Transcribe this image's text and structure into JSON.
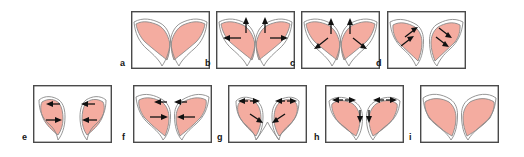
{
  "figure": {
    "title": "",
    "background_color": "#ffffff",
    "width": 524,
    "height": 157,
    "fill_color": "#f4aca0",
    "outline_color": "#8a8a8a",
    "frame_color": "#4a4a4a",
    "arrow_color": "#111111",
    "rows": 2,
    "panel_count": 9
  },
  "panels": [
    {
      "id": "a",
      "label": "a",
      "row": 1,
      "x": 131,
      "y": 11,
      "width": 79,
      "height": 58,
      "arrows": [],
      "arrow_count": 0,
      "description": "baseline symmetric paired lobes meeting at midline"
    },
    {
      "id": "b",
      "label": "b",
      "row": 1,
      "x": 216,
      "y": 11,
      "width": 79,
      "height": 58,
      "arrow_count": 4,
      "arrows": [
        {
          "direction": "up",
          "side": "left"
        },
        {
          "direction": "up",
          "side": "right"
        },
        {
          "direction": "left",
          "side": "left"
        },
        {
          "direction": "right",
          "side": "right"
        }
      ],
      "description": "upward and outward expansion arrows on both lobes"
    },
    {
      "id": "c",
      "label": "c",
      "row": 1,
      "x": 301,
      "y": 11,
      "width": 79,
      "height": 58,
      "arrow_count": 4,
      "arrows": [
        {
          "direction": "up",
          "side": "left"
        },
        {
          "direction": "up",
          "side": "right"
        },
        {
          "direction": "down-left",
          "side": "left"
        },
        {
          "direction": "down-right",
          "side": "right"
        }
      ],
      "description": "upward arrows with diagonal downward-outward arrows"
    },
    {
      "id": "d",
      "label": "d",
      "row": 1,
      "x": 387,
      "y": 11,
      "width": 79,
      "height": 58,
      "arrow_count": 4,
      "arrows": [
        {
          "direction": "up-right",
          "side": "left"
        },
        {
          "direction": "up-right",
          "side": "left"
        },
        {
          "direction": "down-right",
          "side": "right"
        },
        {
          "direction": "down-right",
          "side": "right"
        }
      ],
      "description": "paired diagonal arrows on narrowed separated lobes"
    },
    {
      "id": "e",
      "label": "e",
      "row": 2,
      "x": 33,
      "y": 85,
      "width": 79,
      "height": 58,
      "arrow_count": 4,
      "arrows": [
        {
          "direction": "left",
          "side": "left-top"
        },
        {
          "direction": "left",
          "side": "right-top"
        },
        {
          "direction": "right",
          "side": "left-mid"
        },
        {
          "direction": "left",
          "side": "right-mid"
        }
      ],
      "description": "horizontal inward arrows at top and middle of both lobes"
    },
    {
      "id": "f",
      "label": "f",
      "row": 2,
      "x": 133,
      "y": 85,
      "width": 79,
      "height": 58,
      "arrow_count": 4,
      "arrows": [
        {
          "direction": "left",
          "side": "left-top"
        },
        {
          "direction": "left",
          "side": "right-top"
        },
        {
          "direction": "right",
          "side": "left-mid"
        },
        {
          "direction": "left",
          "side": "right-mid"
        }
      ],
      "description": "inward converging arrows toward the midline"
    },
    {
      "id": "g",
      "label": "g",
      "row": 2,
      "x": 228,
      "y": 85,
      "width": 79,
      "height": 58,
      "arrow_count": 6,
      "arrows": [
        {
          "direction": "left",
          "side": "left-top"
        },
        {
          "direction": "right",
          "side": "left-top"
        },
        {
          "direction": "left",
          "side": "right-top"
        },
        {
          "direction": "right",
          "side": "right-top"
        },
        {
          "direction": "down-right",
          "side": "left-mid"
        },
        {
          "direction": "down-left",
          "side": "right-mid"
        }
      ],
      "description": "opposed top arrows with inward diagonal arrows toward midline"
    },
    {
      "id": "h",
      "label": "h",
      "row": 2,
      "x": 325,
      "y": 85,
      "width": 79,
      "height": 58,
      "arrow_count": 6,
      "arrows": [
        {
          "direction": "left",
          "side": "left-top"
        },
        {
          "direction": "right",
          "side": "left-top"
        },
        {
          "direction": "left",
          "side": "right-top"
        },
        {
          "direction": "right",
          "side": "right-top"
        },
        {
          "direction": "down",
          "side": "left-mid"
        },
        {
          "direction": "down",
          "side": "right-mid"
        }
      ],
      "description": "opposed top arrows with downward arrows at midline"
    },
    {
      "id": "i",
      "label": "i",
      "row": 2,
      "x": 420,
      "y": 85,
      "width": 79,
      "height": 58,
      "arrow_count": 0,
      "arrows": [],
      "description": "final symmetric broad lobes without arrows"
    }
  ]
}
